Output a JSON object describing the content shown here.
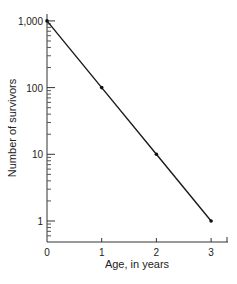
{
  "chart_data": {
    "type": "line",
    "title": "",
    "xlabel": "Age, in years",
    "ylabel": "Number of survivors",
    "yscale": "log",
    "x": [
      0,
      1,
      2,
      3
    ],
    "series": [
      {
        "name": "survivors",
        "values": [
          1000,
          100,
          10,
          1
        ]
      }
    ],
    "x_ticks": [
      "0",
      "1",
      "2",
      "3"
    ],
    "y_ticks": [
      "1",
      "10",
      "100",
      "1,000"
    ],
    "xlim": [
      0,
      3.3
    ],
    "ylim": [
      0.5,
      1000
    ],
    "grid": false,
    "legend": "none",
    "line_color": "#1a1a1a"
  }
}
